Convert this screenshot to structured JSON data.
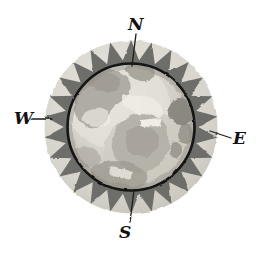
{
  "figure": {
    "background_color": "#ffffff"
  },
  "compass": {
    "center_x": 131,
    "center_y": 127,
    "outer_radius": 87,
    "inner_radius": 64,
    "ring_fill_color": "#d9d7d0",
    "tooth_color": "#6f6f6d",
    "inner_outline_color": "#111111",
    "tooth_count": 26
  },
  "globe": {
    "base_color": "#d3d0c8",
    "ocean_color": "#c9c7bf",
    "land_color": "#a8a49b",
    "highlight_color": "#efece4",
    "shadow_color": "#8d8a82",
    "description": "grayscale watercolor map of the Atlantic hemisphere"
  },
  "labels": {
    "north": "N",
    "west": "W",
    "east": "E",
    "south": "S"
  },
  "pointers": {
    "north": {
      "from_x": 136,
      "from_y": 34,
      "to_x": 131,
      "to_y": 66
    },
    "west": {
      "from_x": 31,
      "from_y": 119,
      "to_x": 52,
      "to_y": 119
    },
    "east": {
      "from_x": 231,
      "from_y": 138,
      "to_x": 210,
      "to_y": 132
    },
    "south": {
      "from_x": 130,
      "from_y": 222,
      "to_x": 133,
      "to_y": 192
    }
  }
}
